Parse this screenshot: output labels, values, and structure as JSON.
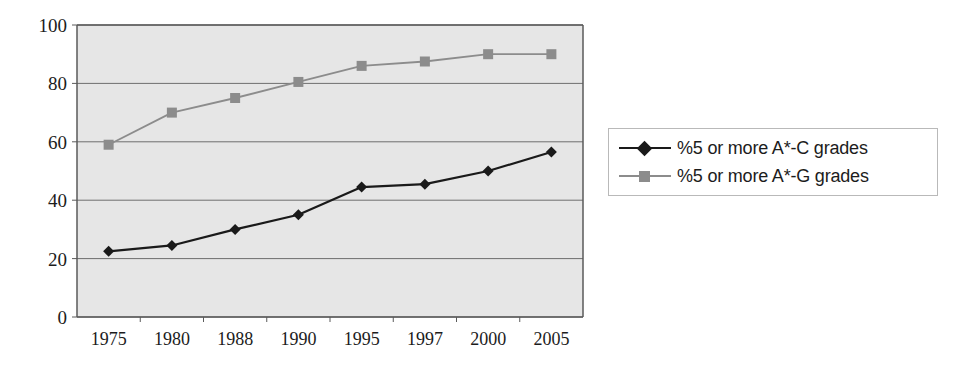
{
  "chart_data": {
    "type": "line",
    "title": "",
    "subtitle": "",
    "xlabel": "",
    "ylabel": "",
    "categories": [
      "1975",
      "1980",
      "1988",
      "1990",
      "1995",
      "1997",
      "2000",
      "2005"
    ],
    "series": [
      {
        "name": "%5 or more A*-C grades",
        "marker": "diamond",
        "color": "#1a1a1a",
        "values": [
          22.5,
          24.5,
          30,
          35,
          44.5,
          45.5,
          50,
          56.5
        ]
      },
      {
        "name": "%5 or more A*-G grades",
        "marker": "square",
        "color": "#8c8c8c",
        "values": [
          59,
          70,
          75,
          80.5,
          86,
          87.5,
          90,
          90
        ]
      }
    ],
    "ylim": [
      0,
      100
    ],
    "yticks": [
      0,
      20,
      40,
      60,
      80,
      100
    ],
    "ytick_labels": [
      "0",
      "20",
      "40",
      "60",
      "80",
      "100"
    ],
    "grid": "horizontal",
    "legend_position": "right",
    "plot_background": "#e6e6e6",
    "grid_color": "#6e6e6e",
    "axis_color": "#5a5a5a"
  }
}
